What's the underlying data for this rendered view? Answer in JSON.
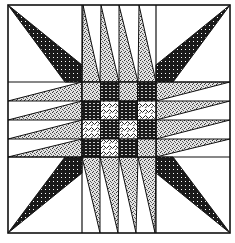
{
  "title": "",
  "quilt_block": {
    "outer": {
      "x": 8,
      "y": 5,
      "size": 222
    },
    "grid_lines": {
      "vertical": [
        82,
        156
      ],
      "horizontal": [
        82,
        157
      ]
    },
    "center": {
      "x": 82,
      "y": 82,
      "size": 75,
      "rows": 4,
      "cols": 4
    },
    "colors": {
      "line": "#111111",
      "dark": "#1a1a1a",
      "medium": "#9a9a9a",
      "light": "#d6d6d6",
      "background": "#ffffff"
    },
    "patterns": [
      "dots-dark",
      "stipple-light",
      "swirl-light"
    ],
    "corner_spikes": [
      "top-left",
      "top-right",
      "bottom-left",
      "bottom-right"
    ],
    "edge_spike_count": 4
  }
}
